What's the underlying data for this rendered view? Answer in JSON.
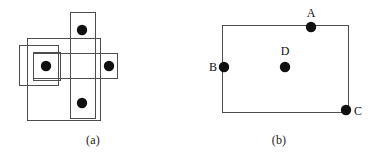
{
  "figure": {
    "width": 372,
    "height": 162,
    "background": "#ffffff",
    "stroke_color": "#4d4d4d",
    "dot_color": "#101010",
    "label_color": "#101010"
  },
  "panel_a": {
    "caption": "(a)",
    "description": "four points in a plus arrangement enclosed by overlapping axis-aligned rectangles",
    "points": [
      {
        "name": "left-point",
        "cx": 46,
        "cy": 66,
        "r": 5.2
      },
      {
        "name": "top-point",
        "cx": 82,
        "cy": 30,
        "r": 5.2
      },
      {
        "name": "right-point",
        "cx": 109,
        "cy": 66,
        "r": 5.2
      },
      {
        "name": "bottom-point",
        "cx": 82,
        "cy": 103,
        "r": 5.2
      }
    ],
    "rectangles": [
      {
        "name": "vertical-rect",
        "x": 70,
        "y": 12,
        "width": 25,
        "height": 106
      },
      {
        "name": "outer-bounding-rect",
        "x": 27,
        "y": 38,
        "width": 73,
        "height": 82
      },
      {
        "name": "horizontal-rect",
        "x": 33,
        "y": 53,
        "width": 84,
        "height": 25
      },
      {
        "name": "left-outer-rect",
        "x": 19,
        "y": 45,
        "width": 39,
        "height": 40
      },
      {
        "name": "left-inner-rect",
        "x": 33,
        "y": 52,
        "width": 27,
        "height": 28
      }
    ]
  },
  "panel_b": {
    "caption": "(b)",
    "description": "single rectangle with four labelled points A, B, C, D",
    "rectangles": [
      {
        "name": "bounding-rect",
        "x": 36,
        "y": 25,
        "width": 126,
        "height": 87
      }
    ],
    "points": [
      {
        "name": "point-A",
        "label": "A",
        "cx": 125,
        "cy": 27,
        "r": 5.2,
        "label_x": 125,
        "label_y": 17,
        "label_anchor": "middle"
      },
      {
        "name": "point-B",
        "label": "B",
        "cx": 38,
        "cy": 67,
        "r": 5.2,
        "label_x": 27,
        "label_y": 71,
        "label_anchor": "middle"
      },
      {
        "name": "point-C",
        "label": "C",
        "cx": 160,
        "cy": 110,
        "r": 5.2,
        "label_x": 172,
        "label_y": 115,
        "label_anchor": "middle"
      },
      {
        "name": "point-D",
        "label": "D",
        "cx": 99,
        "cy": 67,
        "r": 5.2,
        "label_x": 99,
        "label_y": 55,
        "label_anchor": "middle"
      }
    ]
  }
}
